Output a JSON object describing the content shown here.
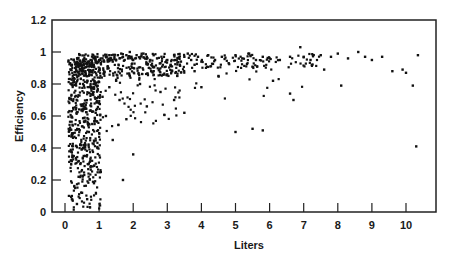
{
  "chart_data": {
    "type": "scatter",
    "title": "",
    "xlabel": "Liters",
    "ylabel": "Efficiency",
    "xlim": [
      -0.4,
      10.9
    ],
    "ylim": [
      0,
      1.2
    ],
    "xticks": [
      0,
      1,
      2,
      3,
      4,
      5,
      6,
      7,
      8,
      9,
      10
    ],
    "yticks": [
      0,
      0.2,
      0.4,
      0.6,
      0.8,
      1,
      1.2
    ],
    "ytick_labels": [
      "0",
      "0.2",
      "0.4",
      "0.6",
      "0.8",
      "1",
      "1.2"
    ],
    "grid": false,
    "legend": null,
    "marker_color": "#111111",
    "series": [
      {
        "name": "observations",
        "points": [
          [
            0.1,
            0.94
          ],
          [
            0.15,
            0.93
          ],
          [
            0.2,
            0.92
          ],
          [
            0.25,
            0.95
          ],
          [
            0.3,
            0.9
          ],
          [
            0.35,
            0.93
          ],
          [
            0.4,
            0.91
          ],
          [
            0.45,
            0.94
          ],
          [
            0.5,
            0.9
          ],
          [
            0.55,
            0.92
          ],
          [
            0.6,
            0.88
          ],
          [
            0.65,
            0.93
          ],
          [
            0.7,
            0.91
          ],
          [
            0.75,
            0.95
          ],
          [
            0.8,
            0.93
          ],
          [
            0.85,
            0.96
          ],
          [
            0.9,
            0.94
          ],
          [
            0.95,
            0.97
          ],
          [
            1.0,
            0.95
          ],
          [
            1.05,
            0.93
          ],
          [
            1.1,
            0.96
          ],
          [
            1.15,
            0.94
          ],
          [
            1.2,
            0.97
          ],
          [
            1.25,
            0.95
          ],
          [
            1.3,
            0.98
          ],
          [
            1.35,
            0.96
          ],
          [
            1.4,
            0.94
          ],
          [
            1.45,
            0.97
          ],
          [
            1.5,
            0.95
          ],
          [
            1.55,
            0.98
          ],
          [
            1.6,
            0.96
          ],
          [
            1.65,
            0.99
          ],
          [
            1.7,
            0.97
          ],
          [
            1.75,
            0.95
          ],
          [
            1.8,
            0.98
          ],
          [
            1.85,
            0.96
          ],
          [
            1.9,
            1.0
          ],
          [
            1.95,
            0.97
          ],
          [
            2.0,
            0.95
          ],
          [
            2.1,
            0.98
          ],
          [
            2.2,
            0.96
          ],
          [
            2.3,
            0.99
          ],
          [
            2.4,
            0.97
          ],
          [
            2.5,
            0.95
          ],
          [
            2.6,
            0.98
          ],
          [
            2.7,
            0.96
          ],
          [
            2.8,
            0.93
          ],
          [
            2.9,
            0.97
          ],
          [
            3.0,
            0.95
          ],
          [
            3.1,
            0.92
          ],
          [
            3.2,
            0.98
          ],
          [
            3.3,
            0.96
          ],
          [
            3.4,
            0.94
          ],
          [
            3.5,
            0.97
          ],
          [
            3.6,
            0.99
          ],
          [
            3.7,
            0.95
          ],
          [
            3.8,
            0.92
          ],
          [
            3.9,
            0.97
          ],
          [
            4.0,
            0.94
          ],
          [
            4.2,
            0.98
          ],
          [
            4.4,
            0.95
          ],
          [
            4.6,
            0.97
          ],
          [
            4.8,
            0.93
          ],
          [
            5.0,
            0.98
          ],
          [
            5.2,
            0.96
          ],
          [
            5.4,
            0.99
          ],
          [
            5.6,
            0.95
          ],
          [
            5.8,
            0.97
          ],
          [
            6.0,
            0.96
          ],
          [
            6.3,
            0.95
          ],
          [
            6.6,
            0.97
          ],
          [
            6.9,
            1.03
          ],
          [
            7.0,
            0.97
          ],
          [
            7.2,
            0.95
          ],
          [
            7.5,
            0.98
          ],
          [
            7.8,
            0.97
          ],
          [
            8.0,
            0.99
          ],
          [
            8.3,
            0.96
          ],
          [
            8.6,
            1.0
          ],
          [
            8.8,
            0.97
          ],
          [
            9.0,
            0.95
          ],
          [
            9.3,
            0.97
          ],
          [
            9.6,
            0.88
          ],
          [
            9.9,
            0.89
          ],
          [
            10.0,
            0.87
          ],
          [
            10.2,
            0.79
          ],
          [
            10.3,
            0.41
          ],
          [
            10.35,
            0.98
          ],
          [
            0.2,
            0.1
          ],
          [
            0.3,
            0.15
          ],
          [
            0.35,
            0.05
          ],
          [
            0.4,
            0.22
          ],
          [
            0.45,
            0.3
          ],
          [
            0.5,
            0.12
          ],
          [
            0.55,
            0.35
          ],
          [
            0.6,
            0.42
          ],
          [
            0.65,
            0.08
          ],
          [
            0.7,
            0.5
          ],
          [
            0.75,
            0.28
          ],
          [
            0.8,
            0.55
          ],
          [
            0.85,
            0.18
          ],
          [
            0.9,
            0.62
          ],
          [
            0.95,
            0.4
          ],
          [
            1.0,
            0.68
          ],
          [
            1.05,
            0.25
          ],
          [
            1.1,
            0.72
          ],
          [
            1.2,
            0.6
          ],
          [
            1.3,
            0.78
          ],
          [
            1.4,
            0.45
          ],
          [
            1.5,
            0.82
          ],
          [
            1.6,
            0.7
          ],
          [
            1.7,
            0.2
          ],
          [
            1.8,
            0.58
          ],
          [
            1.9,
            0.85
          ],
          [
            2.0,
            0.36
          ],
          [
            2.2,
            0.8
          ],
          [
            2.4,
            0.66
          ],
          [
            2.6,
            0.88
          ],
          [
            2.8,
            0.75
          ],
          [
            3.0,
            0.86
          ],
          [
            3.2,
            0.7
          ],
          [
            3.5,
            0.62
          ],
          [
            3.8,
            0.88
          ],
          [
            4.0,
            0.78
          ],
          [
            4.5,
            0.85
          ],
          [
            5.0,
            0.5
          ],
          [
            5.5,
            0.52
          ],
          [
            5.8,
            0.51
          ],
          [
            6.1,
            0.82
          ],
          [
            6.6,
            0.74
          ],
          [
            6.7,
            0.7
          ],
          [
            7.6,
            0.89
          ],
          [
            8.1,
            0.79
          ]
        ]
      }
    ]
  }
}
